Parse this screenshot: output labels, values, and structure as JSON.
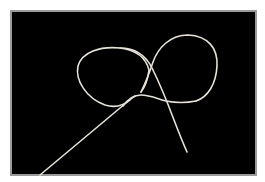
{
  "image": {
    "description": "Photograph of a thin light-colored string forming a loose figure-eight knot on a black background",
    "background_color": "#000000",
    "border_color": "#9a9a9a",
    "string_color": "#e6e2d8"
  }
}
